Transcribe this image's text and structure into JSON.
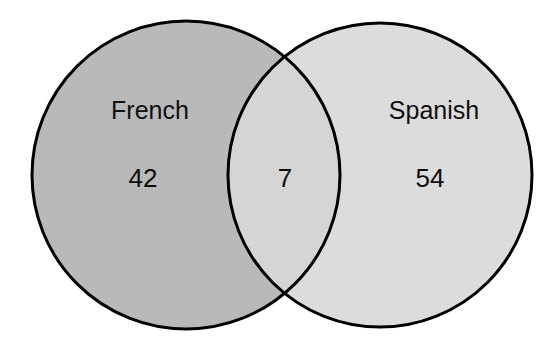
{
  "figure": {
    "type": "venn-diagram",
    "background_color": "#ffffff",
    "width": 556,
    "height": 349,
    "outline_color": "#000000",
    "outline_width": 3
  },
  "sets": {
    "left": {
      "label": "French",
      "count": "42",
      "fill_color": "#b9b9b9",
      "center_x": 186,
      "center_y": 175,
      "radius": 154,
      "label_x": 150,
      "label_y": 112,
      "count_x": 143,
      "count_y": 180
    },
    "right": {
      "label": "Spanish",
      "count": "54",
      "fill_color": "#dcdcdc",
      "center_x": 380,
      "center_y": 175,
      "radius": 152,
      "label_x": 434,
      "label_y": 112,
      "count_x": 430,
      "count_y": 180
    }
  },
  "intersection": {
    "label": "",
    "count": "7",
    "fill_color": "#d5d5d5",
    "count_x": 285,
    "count_y": 180
  },
  "ghost_marks": [
    {
      "text": "",
      "x": 430,
      "y": 90
    },
    {
      "text": "",
      "x": 430,
      "y": 235
    },
    {
      "text": "",
      "x": 430,
      "y": 268
    }
  ],
  "chart_data": {
    "type": "venn",
    "title": "",
    "set_names": [
      "French",
      "Spanish"
    ],
    "regions": [
      {
        "name": "French only",
        "sets": [
          "French"
        ],
        "value": 42
      },
      {
        "name": "French and Spanish",
        "sets": [
          "French",
          "Spanish"
        ],
        "value": 7
      },
      {
        "name": "Spanish only",
        "sets": [
          "Spanish"
        ],
        "value": 54
      }
    ],
    "set_totals": {
      "French": 49,
      "Spanish": 61
    },
    "union_total": 103,
    "labels_shown": [
      "French",
      "Spanish",
      "42",
      "7",
      "54"
    ],
    "legend": "none",
    "grid": false
  }
}
